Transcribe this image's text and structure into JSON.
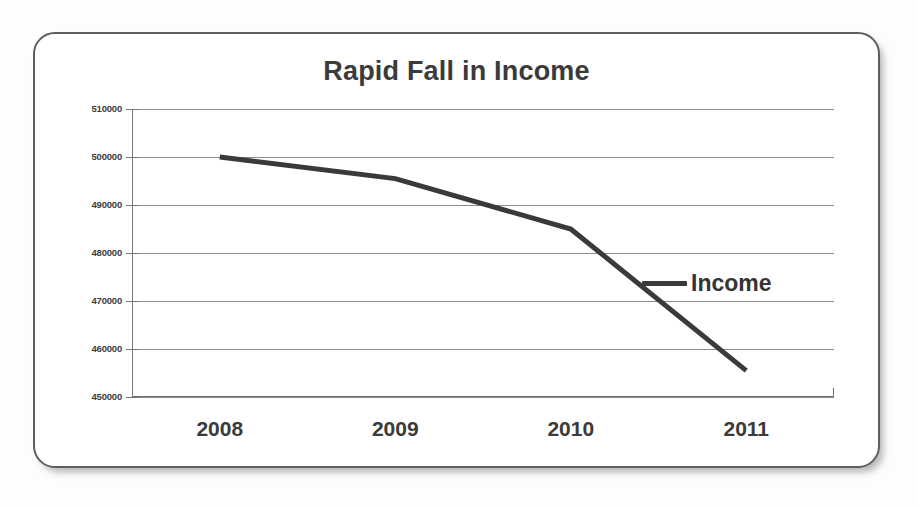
{
  "chart_data": {
    "type": "line",
    "title": "Rapid Fall in Income",
    "xlabel": "",
    "ylabel": "",
    "categories": [
      "2008",
      "2009",
      "2010",
      "2011"
    ],
    "series": [
      {
        "name": "Income",
        "values": [
          500000,
          495500,
          485000,
          455500
        ]
      }
    ],
    "ylim": [
      450000,
      510000
    ],
    "ytick_values": [
      510000,
      500000,
      490000,
      480000,
      470000,
      460000,
      450000
    ],
    "ytick_labels": [
      "510000",
      "500000",
      "490000",
      "480000",
      "470000",
      "460000",
      "450000"
    ],
    "xtick_labels": [
      "2008",
      "2009",
      "2010",
      "2011"
    ],
    "grid": true,
    "legend": [
      "Income"
    ],
    "legend_position": "inside-right",
    "line_color": "#3a3a3a",
    "title_color": "#3b3b3b",
    "gridline_color": "#8c8c8c"
  }
}
